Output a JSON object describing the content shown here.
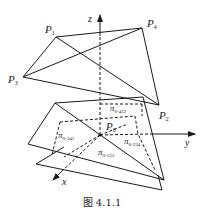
{
  "figure": {
    "caption": "图 4.1.1",
    "axes": {
      "x": "x",
      "y": "y",
      "z": "z"
    },
    "points": {
      "P1": {
        "name": "P",
        "sub": "1"
      },
      "P2": {
        "name": "P",
        "sub": "2"
      },
      "P3": {
        "name": "P",
        "sub": "3"
      },
      "P4": {
        "name": "P",
        "sub": "4"
      },
      "P0": {
        "name": "P",
        "sub": "0"
      }
    },
    "planes": {
      "p412": {
        "name": "π",
        "sub": "0-412"
      },
      "p341": {
        "name": "π",
        "sub": "0-341"
      },
      "p234": {
        "name": "π",
        "sub": "0-234"
      },
      "p123": {
        "name": "π",
        "sub": "0-123"
      }
    },
    "colors": {
      "stroke": "#1a1a1a",
      "background": "#ffffff"
    }
  }
}
